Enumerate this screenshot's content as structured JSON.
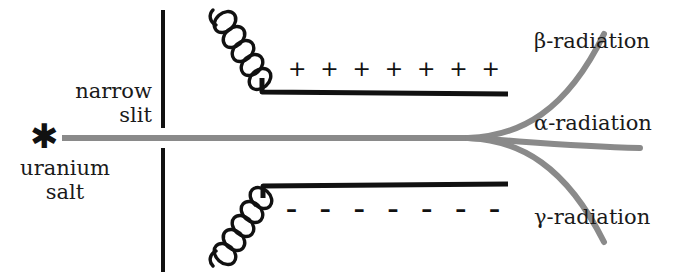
{
  "figure": {
    "colors": {
      "beam": "#8a8a8a",
      "plate": "#111111",
      "slit": "#111111",
      "text": "#1a1a1a"
    }
  },
  "source": {
    "marker": "asterisk-icon",
    "marker_glyph": "✱",
    "label_line1": "uranium",
    "label_line2": "salt"
  },
  "collimator": {
    "label_line1": "narrow",
    "label_line2": "slit"
  },
  "capacitor": {
    "upper_plate": {
      "charge_sign": "+",
      "charge_count": 7,
      "charges": [
        "+",
        "+",
        "+",
        "+",
        "+",
        "+",
        "+"
      ],
      "lead": "helical-coil"
    },
    "lower_plate": {
      "charge_sign": "–",
      "charge_count": 7,
      "charges": [
        "–",
        "–",
        "–",
        "–",
        "–",
        "–",
        "–"
      ],
      "lead": "helical-coil"
    }
  },
  "beams": [
    {
      "id": "beta",
      "label": "β-radiation",
      "deflection": "up"
    },
    {
      "id": "alpha",
      "label": "α-radiation",
      "deflection": "slight-down"
    },
    {
      "id": "gamma",
      "label": "γ-radiation",
      "deflection": "down"
    }
  ]
}
